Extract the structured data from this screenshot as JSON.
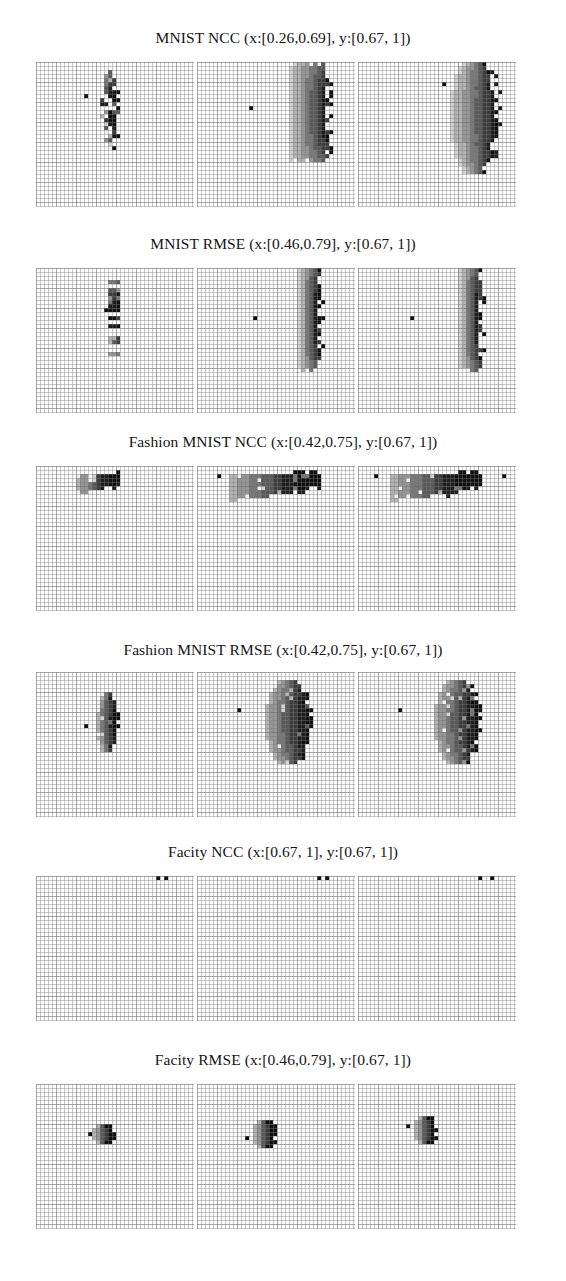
{
  "figure": {
    "width": 566,
    "height": 1281,
    "background": "#ffffff",
    "title_color": "#141414",
    "grid_color": "#787878",
    "panels_per_row": 3,
    "panel_width": 158,
    "panel_height": 145,
    "cell_size": 4
  },
  "rows": [
    {
      "id": "mnist-ncc",
      "title": "MNIST NCC (x:[0.26,0.69], y:[0.67, 1])",
      "dataset": "MNIST",
      "metric": "NCC",
      "x_range": [
        0.26,
        0.69
      ],
      "y_range": [
        0.67,
        1
      ]
    },
    {
      "id": "mnist-rmse",
      "title": "MNIST RMSE (x:[0.46,0.79], y:[0.67, 1])",
      "dataset": "MNIST",
      "metric": "RMSE",
      "x_range": [
        0.46,
        0.79
      ],
      "y_range": [
        0.67,
        1
      ]
    },
    {
      "id": "fashion-mnist-ncc",
      "title": "Fashion MNIST NCC (x:[0.42,0.75], y:[0.67, 1])",
      "dataset": "Fashion MNIST",
      "metric": "NCC",
      "x_range": [
        0.42,
        0.75
      ],
      "y_range": [
        0.67,
        1
      ]
    },
    {
      "id": "fashion-mnist-rmse",
      "title": "Fashion MNIST RMSE (x:[0.42,0.75], y:[0.67, 1])",
      "dataset": "Fashion MNIST",
      "metric": "RMSE",
      "x_range": [
        0.42,
        0.75
      ],
      "y_range": [
        0.67,
        1
      ]
    },
    {
      "id": "facity-ncc",
      "title": "Facity NCC (x:[0.67, 1], y:[0.67, 1])",
      "dataset": "Facity",
      "metric": "NCC",
      "x_range": [
        0.67,
        1
      ],
      "y_range": [
        0.67,
        1
      ]
    },
    {
      "id": "facity-rmse",
      "title": "Facity RMSE (x:[0.46,0.79], y:[0.67, 1])",
      "dataset": "Facity",
      "metric": "RMSE",
      "x_range": [
        0.46,
        0.79
      ],
      "y_range": [
        0.67,
        1
      ]
    }
  ],
  "chart_data": {
    "type": "heatmap",
    "xlabel": "",
    "ylabel": "",
    "grid": true,
    "legend": "none",
    "colormap": "grayscale-dark-on-white",
    "colormap_levels": [
      "#f2f2f2",
      "#d2d2d2",
      "#b4b4b4",
      "#969696",
      "#787878",
      "#5a5a5a",
      "#3c3c3c",
      "#1e1e1e",
      "#101010"
    ],
    "panel_grid": {
      "rows": 6,
      "cols": 3
    },
    "cell_grid": {
      "cols": 39,
      "rows": 36
    },
    "note": "Each of the 18 panels shows a binned 2D histogram; cell values encoded as gray levels 0-8 where 0 is near-white and 8 is near-black.",
    "panels": [
      {
        "row": "mnist-ncc",
        "col": 0,
        "outlier_marks": [
          [
            12,
            8
          ]
        ],
        "blob": {
          "shape": "vertical-sparse-column",
          "cx": 18,
          "cy": 11,
          "half_width": 2,
          "half_height": 10,
          "peak_level": 8
        }
      },
      {
        "row": "mnist-ncc",
        "col": 1,
        "outlier_marks": [
          [
            13,
            11
          ]
        ],
        "blob": {
          "shape": "vertical-bar-ragged-right",
          "cx": 27,
          "cy": 12,
          "half_width": 4,
          "half_height": 12,
          "peak_level": 8
        }
      },
      {
        "row": "mnist-ncc",
        "col": 2,
        "outlier_marks": [
          [
            21,
            5
          ]
        ],
        "blob": {
          "shape": "vertical-lens-ragged-right",
          "cx": 28,
          "cy": 13,
          "half_width": 5,
          "half_height": 14,
          "peak_level": 8
        }
      },
      {
        "row": "mnist-rmse",
        "col": 0,
        "outlier_marks": [
          [
            17,
            10
          ]
        ],
        "blob": {
          "shape": "narrow-vertical-dotted",
          "cx": 19,
          "cy": 11,
          "half_width": 1,
          "half_height": 10,
          "peak_level": 8
        }
      },
      {
        "row": "mnist-rmse",
        "col": 1,
        "outlier_marks": [
          [
            14,
            12
          ]
        ],
        "blob": {
          "shape": "narrow-vertical-bar",
          "cx": 27,
          "cy": 12,
          "half_width": 2,
          "half_height": 13,
          "peak_level": 8
        }
      },
      {
        "row": "mnist-rmse",
        "col": 2,
        "outlier_marks": [
          [
            13,
            12
          ]
        ],
        "blob": {
          "shape": "narrow-vertical-bar",
          "cx": 27,
          "cy": 12,
          "half_width": 2,
          "half_height": 13,
          "peak_level": 8
        }
      },
      {
        "row": "fashion-mnist-ncc",
        "col": 0,
        "outlier_marks": [],
        "blob": {
          "shape": "horizontal-wedge",
          "cx": 15,
          "cy": 3,
          "half_width": 5,
          "half_height": 3,
          "peak_level": 8
        }
      },
      {
        "row": "fashion-mnist-ncc",
        "col": 1,
        "outlier_marks": [
          [
            5,
            2
          ]
        ],
        "blob": {
          "shape": "horizontal-wedge-wide",
          "cx": 19,
          "cy": 3,
          "half_width": 11,
          "half_height": 4,
          "peak_level": 8
        }
      },
      {
        "row": "fashion-mnist-ncc",
        "col": 2,
        "outlier_marks": [
          [
            4,
            2
          ],
          [
            36,
            2
          ]
        ],
        "blob": {
          "shape": "horizontal-wedge-wide",
          "cx": 19,
          "cy": 3,
          "half_width": 11,
          "half_height": 4,
          "peak_level": 8
        }
      },
      {
        "row": "fashion-mnist-rmse",
        "col": 0,
        "outlier_marks": [
          [
            12,
            13
          ]
        ],
        "blob": {
          "shape": "small-vertical-lens",
          "cx": 17,
          "cy": 12,
          "half_width": 2,
          "half_height": 7,
          "peak_level": 8
        }
      },
      {
        "row": "fashion-mnist-rmse",
        "col": 1,
        "outlier_marks": [
          [
            10,
            9
          ]
        ],
        "blob": {
          "shape": "vertical-lens",
          "cx": 22,
          "cy": 12,
          "half_width": 5,
          "half_height": 10,
          "peak_level": 8
        }
      },
      {
        "row": "fashion-mnist-rmse",
        "col": 2,
        "outlier_marks": [
          [
            10,
            9
          ]
        ],
        "blob": {
          "shape": "vertical-lens",
          "cx": 24,
          "cy": 12,
          "half_width": 5,
          "half_height": 10,
          "peak_level": 8
        }
      },
      {
        "row": "facity-ncc",
        "col": 0,
        "outlier_marks": [
          [
            30,
            0
          ],
          [
            32,
            0
          ]
        ],
        "blob": null
      },
      {
        "row": "facity-ncc",
        "col": 1,
        "outlier_marks": [
          [
            30,
            0
          ],
          [
            32,
            0
          ]
        ],
        "blob": null
      },
      {
        "row": "facity-ncc",
        "col": 2,
        "outlier_marks": [
          [
            30,
            0
          ],
          [
            33,
            0
          ]
        ],
        "blob": null
      },
      {
        "row": "facity-rmse",
        "col": 0,
        "outlier_marks": [
          [
            13,
            12
          ]
        ],
        "blob": {
          "shape": "compact-dot",
          "cx": 16,
          "cy": 12,
          "half_width": 2,
          "half_height": 2,
          "peak_level": 8
        }
      },
      {
        "row": "facity-rmse",
        "col": 1,
        "outlier_marks": [
          [
            12,
            13
          ]
        ],
        "blob": {
          "shape": "compact-dot",
          "cx": 16,
          "cy": 12,
          "half_width": 2,
          "half_height": 3,
          "peak_level": 8
        }
      },
      {
        "row": "facity-rmse",
        "col": 2,
        "outlier_marks": [
          [
            12,
            10
          ]
        ],
        "blob": {
          "shape": "compact-dot",
          "cx": 16,
          "cy": 11,
          "half_width": 2,
          "half_height": 3,
          "peak_level": 8
        }
      }
    ]
  }
}
